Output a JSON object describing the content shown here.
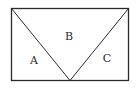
{
  "diagram": {
    "type": "geometry",
    "shape": "rectangle divided by two lines from top corners to a point on the bottom edge",
    "colors": {
      "stroke": "#2a2a2a",
      "background": "#ffffff"
    },
    "rectangle": {
      "x1": 11.5,
      "y1": 8.5,
      "x2": 128.5,
      "y2": 80.5
    },
    "apex": {
      "x": 70,
      "y": 80.5
    },
    "regions": [
      {
        "label": "A",
        "x": 34,
        "y": 64
      },
      {
        "label": "B",
        "x": 69,
        "y": 40
      },
      {
        "label": "C",
        "x": 107,
        "y": 62
      }
    ]
  }
}
